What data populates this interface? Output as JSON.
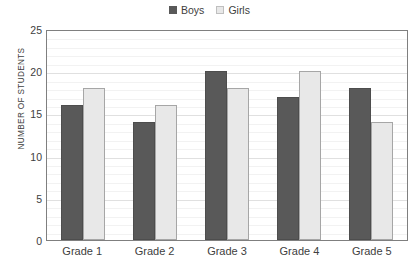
{
  "legend": {
    "position": "top-center",
    "entries": [
      {
        "label": "Boys",
        "color": "#595959",
        "swatch": "legend-swatch-dark"
      },
      {
        "label": "Girls",
        "color": "#e8e8e8",
        "swatch": "legend-swatch-light"
      }
    ]
  },
  "axes": {
    "ylabel": "NUMBER OF STUDENTS",
    "xlabel": "",
    "yticks": [
      0,
      5,
      10,
      15,
      20,
      25
    ],
    "ylim": [
      0,
      25
    ],
    "grid": "horizontal-minor-every-1-major-every-5"
  },
  "chart_data": {
    "type": "bar",
    "title": "",
    "subtitle": "",
    "xlabel": "",
    "ylabel": "NUMBER OF STUDENTS",
    "ylim": [
      0,
      25
    ],
    "ytick_step": 5,
    "grid": true,
    "legend_position": "top-center",
    "categories": [
      "Grade 1",
      "Grade 2",
      "Grade 3",
      "Grade 4",
      "Grade 5"
    ],
    "series": [
      {
        "name": "Boys",
        "color": "#595959",
        "values": [
          16,
          14,
          20,
          17,
          18
        ]
      },
      {
        "name": "Girls",
        "color": "#e8e8e8",
        "values": [
          18,
          16,
          18,
          20,
          14
        ]
      }
    ]
  }
}
